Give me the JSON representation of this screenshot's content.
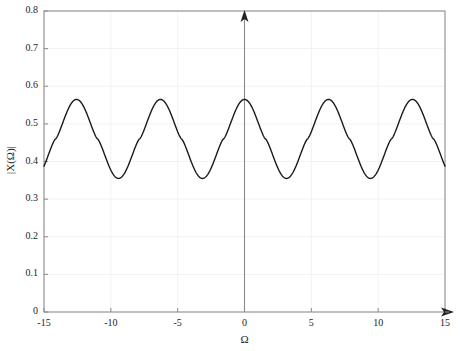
{
  "chart_data": {
    "type": "line",
    "title": "",
    "subtitle": "",
    "xlabel": "Ω",
    "ylabel": "|X(Ω)|",
    "xlim": [
      -15,
      15
    ],
    "ylim": [
      0,
      0.8
    ],
    "xticks": [
      -15,
      -10,
      -5,
      0,
      5,
      10,
      15
    ],
    "xtick_labels": [
      "-15",
      "-10",
      "-5",
      "0",
      "5",
      "10",
      "15"
    ],
    "yticks": [
      0,
      0.1,
      0.2,
      0.3,
      0.4,
      0.5,
      0.6,
      0.7,
      0.8
    ],
    "ytick_labels": [
      "0",
      "0.1",
      "0.2",
      "0.3",
      "0.4",
      "0.5",
      "0.6",
      "0.7",
      "0.8"
    ],
    "grid": true,
    "legend": null,
    "legend_position": "none",
    "axis_arrows": {
      "x_axis_arrow_right": true,
      "y_axis_arrow_up": true,
      "y_axis_at_x": 0
    },
    "series": [
      {
        "name": "|X(Ω)|",
        "color": "#1a1a1a",
        "line_width": 1.4,
        "period": 6.283185307179586,
        "peak_value": 0.565,
        "trough_value": 0.355,
        "mean_value": 0.46,
        "peak_positions": [
          -12.566,
          -9.425,
          -6.283,
          -3.142,
          0,
          3.142,
          6.283,
          9.425,
          12.566
        ],
        "trough_positions": [
          -14.137,
          -10.996,
          -7.854,
          -4.712,
          -1.571,
          1.571,
          4.712,
          7.854,
          10.996,
          14.137
        ],
        "x": [
          -15,
          -14.5,
          -14,
          -13.5,
          -13,
          -12.566,
          -12,
          -11.5,
          -11,
          -10.5,
          -10,
          -9.425,
          -9,
          -8.5,
          -8,
          -7.854,
          -7.5,
          -7,
          -6.5,
          -6.283,
          -6,
          -5.5,
          -5,
          -4.712,
          -4.5,
          -4,
          -3.5,
          -3.142,
          -3,
          -2.5,
          -2,
          -1.571,
          -1.5,
          -1,
          -0.5,
          0,
          0.5,
          1,
          1.5,
          1.571,
          2,
          2.5,
          3,
          3.142,
          3.5,
          4,
          4.5,
          4.712,
          5,
          5.5,
          6,
          6.283,
          6.5,
          7,
          7.5,
          7.854,
          8,
          8.5,
          9,
          9.425,
          10,
          10.5,
          11,
          11.5,
          12,
          12.566,
          13,
          13.5,
          14,
          14.5,
          15
        ],
        "y": [
          0.441,
          0.382,
          0.358,
          0.376,
          0.455,
          0.565,
          0.518,
          0.414,
          0.359,
          0.363,
          0.425,
          0.565,
          0.553,
          0.449,
          0.373,
          0.356,
          0.376,
          0.469,
          0.556,
          0.565,
          0.535,
          0.426,
          0.362,
          0.355,
          0.364,
          0.441,
          0.546,
          0.565,
          0.556,
          0.452,
          0.373,
          0.355,
          0.357,
          0.42,
          0.523,
          0.565,
          0.523,
          0.42,
          0.357,
          0.355,
          0.373,
          0.452,
          0.556,
          0.565,
          0.546,
          0.441,
          0.364,
          0.355,
          0.362,
          0.426,
          0.535,
          0.565,
          0.556,
          0.469,
          0.376,
          0.356,
          0.373,
          0.449,
          0.553,
          0.565,
          0.425,
          0.363,
          0.359,
          0.414,
          0.518,
          0.565,
          0.455,
          0.376,
          0.358,
          0.382,
          0.441
        ]
      }
    ],
    "colors": {
      "curve": "#1a1a1a",
      "axis": "#8a8a8a",
      "grid": "#f2f2f2",
      "text": "#1c1c1c",
      "background": "#ffffff"
    }
  },
  "plot_box": {
    "left_px": 44,
    "right_px": 445,
    "top_px": 11,
    "bottom_px": 312
  }
}
